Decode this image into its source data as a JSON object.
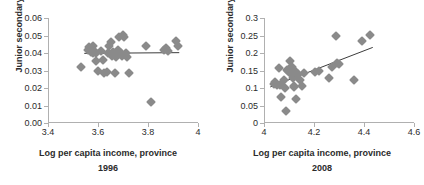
{
  "figure": {
    "panels": [
      "left",
      "right"
    ]
  },
  "chart_data": [
    {
      "type": "scatter",
      "title": "",
      "panel": "left",
      "xlabel": "Log per capita income, province",
      "caption": "1996",
      "ylabel": "Junior secondary",
      "xlim": [
        3.4,
        4.0
      ],
      "ylim": [
        0.0,
        0.06
      ],
      "xticks": [
        3.4,
        3.6,
        3.8,
        4.0
      ],
      "xtick_labels": [
        "3.4",
        "3.6",
        "3.8",
        "4"
      ],
      "yticks": [
        0.0,
        0.01,
        0.02,
        0.03,
        0.04,
        0.05,
        0.06
      ],
      "ytick_labels": [
        "0.00",
        "0.01",
        "0.02",
        "0.03",
        "0.04",
        "0.05",
        "0.06"
      ],
      "grid": false,
      "legend": "none",
      "marker": "diamond",
      "marker_color": "#8a8a8a",
      "trendline": {
        "color": "#3c3c3c",
        "x": [
          3.545,
          3.925
        ],
        "y": [
          0.0398,
          0.0402
        ]
      },
      "points": [
        {
          "x": 3.53,
          "y": 0.0318
        },
        {
          "x": 3.56,
          "y": 0.042
        },
        {
          "x": 3.565,
          "y": 0.0432
        },
        {
          "x": 3.57,
          "y": 0.0408
        },
        {
          "x": 3.572,
          "y": 0.0418
        },
        {
          "x": 3.578,
          "y": 0.04
        },
        {
          "x": 3.58,
          "y": 0.044
        },
        {
          "x": 3.585,
          "y": 0.0412
        },
        {
          "x": 3.59,
          "y": 0.0398
        },
        {
          "x": 3.592,
          "y": 0.0356
        },
        {
          "x": 3.6,
          "y": 0.03
        },
        {
          "x": 3.612,
          "y": 0.0412
        },
        {
          "x": 3.618,
          "y": 0.0358
        },
        {
          "x": 3.625,
          "y": 0.0288
        },
        {
          "x": 3.635,
          "y": 0.029
        },
        {
          "x": 3.64,
          "y": 0.0398
        },
        {
          "x": 3.645,
          "y": 0.044
        },
        {
          "x": 3.65,
          "y": 0.0462
        },
        {
          "x": 3.655,
          "y": 0.0382
        },
        {
          "x": 3.66,
          "y": 0.0408
        },
        {
          "x": 3.668,
          "y": 0.0288
        },
        {
          "x": 3.672,
          "y": 0.0378
        },
        {
          "x": 3.68,
          "y": 0.042
        },
        {
          "x": 3.685,
          "y": 0.0492
        },
        {
          "x": 3.69,
          "y": 0.04
        },
        {
          "x": 3.695,
          "y": 0.0382
        },
        {
          "x": 3.7,
          "y": 0.0505
        },
        {
          "x": 3.705,
          "y": 0.049
        },
        {
          "x": 3.71,
          "y": 0.04
        },
        {
          "x": 3.715,
          "y": 0.0378
        },
        {
          "x": 3.722,
          "y": 0.0288
        },
        {
          "x": 3.79,
          "y": 0.044
        },
        {
          "x": 3.812,
          "y": 0.012
        },
        {
          "x": 3.862,
          "y": 0.0418
        },
        {
          "x": 3.872,
          "y": 0.043
        },
        {
          "x": 3.88,
          "y": 0.0412
        },
        {
          "x": 3.912,
          "y": 0.0468
        },
        {
          "x": 3.918,
          "y": 0.0442
        }
      ]
    },
    {
      "type": "scatter",
      "title": "",
      "panel": "right",
      "xlabel": "Log per capita income, province",
      "caption": "2008",
      "ylabel": "Junior secondary",
      "xlim": [
        4.0,
        4.6
      ],
      "ylim": [
        0.0,
        0.3
      ],
      "xticks": [
        4.0,
        4.2,
        4.4,
        4.6
      ],
      "xtick_labels": [
        "4",
        "4.2",
        "4.4",
        "4.6"
      ],
      "yticks": [
        0.0,
        0.05,
        0.1,
        0.15,
        0.2,
        0.25,
        0.3
      ],
      "ytick_labels": [
        "0",
        "0.05",
        "0.1",
        "0.15",
        "0.2",
        "0.25",
        "0.3"
      ],
      "grid": false,
      "legend": "none",
      "marker": "diamond",
      "marker_color": "#8a8a8a",
      "trendline": {
        "color": "#3c3c3c",
        "x": [
          4.025,
          4.435
        ],
        "y": [
          0.103,
          0.216
        ]
      },
      "points": [
        {
          "x": 4.04,
          "y": 0.112
        },
        {
          "x": 4.045,
          "y": 0.118
        },
        {
          "x": 4.05,
          "y": 0.11
        },
        {
          "x": 4.058,
          "y": 0.158
        },
        {
          "x": 4.062,
          "y": 0.108
        },
        {
          "x": 4.068,
          "y": 0.075
        },
        {
          "x": 4.078,
          "y": 0.122
        },
        {
          "x": 4.082,
          "y": 0.1
        },
        {
          "x": 4.086,
          "y": 0.033
        },
        {
          "x": 4.092,
          "y": 0.152
        },
        {
          "x": 4.096,
          "y": 0.148
        },
        {
          "x": 4.1,
          "y": 0.155
        },
        {
          "x": 4.104,
          "y": 0.178
        },
        {
          "x": 4.106,
          "y": 0.145
        },
        {
          "x": 4.108,
          "y": 0.15
        },
        {
          "x": 4.11,
          "y": 0.138
        },
        {
          "x": 4.112,
          "y": 0.16
        },
        {
          "x": 4.114,
          "y": 0.128
        },
        {
          "x": 4.116,
          "y": 0.143
        },
        {
          "x": 4.118,
          "y": 0.105
        },
        {
          "x": 4.12,
          "y": 0.103
        },
        {
          "x": 4.124,
          "y": 0.148
        },
        {
          "x": 4.128,
          "y": 0.068
        },
        {
          "x": 4.136,
          "y": 0.14
        },
        {
          "x": 4.142,
          "y": 0.122
        },
        {
          "x": 4.15,
          "y": 0.105
        },
        {
          "x": 4.158,
          "y": 0.143
        },
        {
          "x": 4.205,
          "y": 0.145
        },
        {
          "x": 4.218,
          "y": 0.148
        },
        {
          "x": 4.258,
          "y": 0.13
        },
        {
          "x": 4.272,
          "y": 0.16
        },
        {
          "x": 4.288,
          "y": 0.248
        },
        {
          "x": 4.292,
          "y": 0.172
        },
        {
          "x": 4.298,
          "y": 0.168
        },
        {
          "x": 4.36,
          "y": 0.124
        },
        {
          "x": 4.392,
          "y": 0.233
        },
        {
          "x": 4.422,
          "y": 0.251
        }
      ]
    }
  ]
}
